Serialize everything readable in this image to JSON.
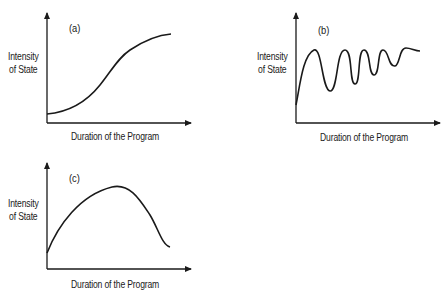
{
  "figure": {
    "panels": [
      {
        "id": "a",
        "tag": "(a)",
        "ylabel_line1": "Intensity",
        "ylabel_line2": "of State",
        "xlabel": "Duration of the Program",
        "shape": "S-shaped (sigmoid) rise"
      },
      {
        "id": "b",
        "tag": "(b)",
        "ylabel_line1": "Intensity",
        "ylabel_line2": "of State",
        "xlabel": "Duration of the Program",
        "shape": "rapid rise then damped oscillation"
      },
      {
        "id": "c",
        "tag": "(c)",
        "ylabel_line1": "Intensity",
        "ylabel_line2": "of State",
        "xlabel": "Duration of the Program",
        "shape": "rise to peak then decline"
      }
    ],
    "line_color": "#1a1a1a"
  }
}
